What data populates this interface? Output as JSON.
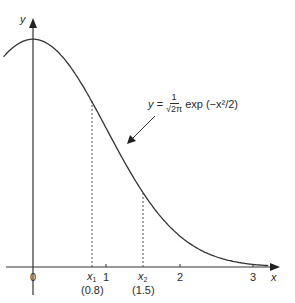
{
  "chart_data": {
    "type": "line",
    "title": "",
    "xlabel": "x",
    "ylabel": "y",
    "function": "y = (1/sqrt(2*pi)) * exp(-x^2/2)",
    "equation_label": {
      "lhs": "y =",
      "numerator": "1",
      "denominator": "√2π",
      "rhs": "exp (−x²/2)"
    },
    "x_ticks": [
      "0",
      "1",
      "2",
      "3"
    ],
    "x_tick_values": [
      0,
      1,
      2,
      3
    ],
    "xlim": [
      -0.4,
      3.9
    ],
    "ylim": [
      0,
      0.42
    ],
    "grid": false,
    "legend": null,
    "series": [
      {
        "name": "standard normal density",
        "x": [
          -0.4,
          0,
          0.2,
          0.4,
          0.6,
          0.8,
          1.0,
          1.2,
          1.4,
          1.5,
          1.6,
          1.8,
          2.0,
          2.2,
          2.4,
          2.6,
          2.8,
          3.0,
          3.2
        ],
        "values": [
          0.368,
          0.399,
          0.391,
          0.368,
          0.333,
          0.29,
          0.242,
          0.194,
          0.15,
          0.13,
          0.111,
          0.079,
          0.054,
          0.035,
          0.022,
          0.014,
          0.008,
          0.004,
          0.002
        ]
      }
    ],
    "annotations": [
      {
        "type": "vline-dashed",
        "x": 0.8,
        "label": "x1",
        "sublabel": "(0.8)"
      },
      {
        "type": "vline-dashed",
        "x": 1.5,
        "label": "x2",
        "sublabel": "(1.5)"
      },
      {
        "type": "arrow",
        "text": "y = 1/√2π exp(−x²/2)",
        "points_to_x": 1.3
      }
    ]
  },
  "labels": {
    "y_axis": "y",
    "x_axis": "x",
    "tick0": "0",
    "tick1": "1",
    "tick2": "2",
    "tick3": "3",
    "x1_main": "x",
    "x1_sub": "1",
    "x1_value": "(0.8)",
    "x2_main": "x",
    "x2_sub": "2",
    "x2_value": "(1.5)"
  }
}
